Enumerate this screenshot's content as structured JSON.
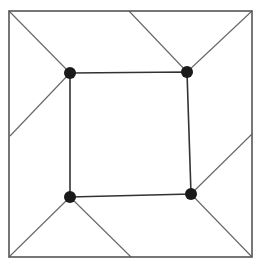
{
  "diagram": {
    "colors": {
      "outer_square": "#555555",
      "inner_square": "#333333",
      "connector": "#666666",
      "dot": "#1a1a1a",
      "background": "#ffffff"
    },
    "outer_square": {
      "x1": 9,
      "y1": 11,
      "x2": 252,
      "y2": 257
    },
    "inner_vertices": [
      {
        "id": "top-left",
        "x": 70,
        "y": 73
      },
      {
        "id": "top-right",
        "x": 187,
        "y": 72
      },
      {
        "id": "bottom-right",
        "x": 191,
        "y": 194
      },
      {
        "id": "bottom-left",
        "x": 70,
        "y": 197
      }
    ],
    "connectors": [
      {
        "from": "top-left",
        "to": {
          "x": 9,
          "y": 11
        }
      },
      {
        "from": "top-left",
        "to": {
          "x": 10,
          "y": 136
        }
      },
      {
        "from": "top-right",
        "to": {
          "x": 129,
          "y": 11
        }
      },
      {
        "from": "top-right",
        "to": {
          "x": 252,
          "y": 11
        }
      },
      {
        "from": "bottom-right",
        "to": {
          "x": 252,
          "y": 134
        }
      },
      {
        "from": "bottom-right",
        "to": {
          "x": 252,
          "y": 257
        }
      },
      {
        "from": "bottom-left",
        "to": {
          "x": 9,
          "y": 257
        }
      },
      {
        "from": "bottom-left",
        "to": {
          "x": 131,
          "y": 257
        }
      }
    ],
    "dot_radius": 6
  }
}
